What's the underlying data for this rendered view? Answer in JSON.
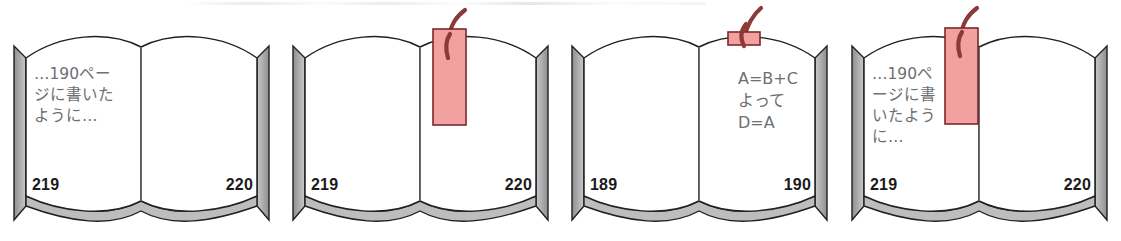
{
  "figure": {
    "panel_count": 4
  },
  "colors": {
    "page_fill": "#ffffff",
    "page_outline": "#221f1f",
    "page_edge_gray": "#b5b5b5",
    "spine_gray": "#9a9a9a",
    "bookmark_fill": "#f2a0a0",
    "bookmark_outline": "#7a2a28",
    "bookmark_string": "#8c3a38",
    "text_gray": "#6d6f72",
    "folio_color": "#1b1b1b",
    "background": "#ffffff"
  },
  "panels": [
    {
      "id": "panel-1",
      "left_page": {
        "folio": "219",
        "lines": [
          "…190ペー",
          "ジに書いた",
          "ように…"
        ]
      },
      "right_page": {
        "folio": "220",
        "lines": []
      },
      "bookmark": {
        "present": false,
        "style": "none"
      }
    },
    {
      "id": "panel-2",
      "left_page": {
        "folio": "219",
        "lines": []
      },
      "right_page": {
        "folio": "220",
        "lines": []
      },
      "bookmark": {
        "present": true,
        "style": "full-ribbon",
        "position": "center-spine",
        "label": "bookmark-ribbon"
      }
    },
    {
      "id": "panel-3",
      "left_page": {
        "folio": "189",
        "lines": []
      },
      "right_page": {
        "folio": "190",
        "lines": [
          "A=B+C",
          "よって",
          "D=A"
        ]
      },
      "bookmark": {
        "present": true,
        "style": "tab-peeking",
        "position": "center-spine",
        "label": "bookmark-tab"
      }
    },
    {
      "id": "panel-4",
      "left_page": {
        "folio": "219",
        "lines": [
          "…190ペ",
          "ージに書",
          "いたよう",
          "に…"
        ]
      },
      "right_page": {
        "folio": "220",
        "lines": []
      },
      "bookmark": {
        "present": true,
        "style": "full-ribbon",
        "position": "left-page-inner",
        "label": "bookmark-ribbon"
      }
    }
  ]
}
